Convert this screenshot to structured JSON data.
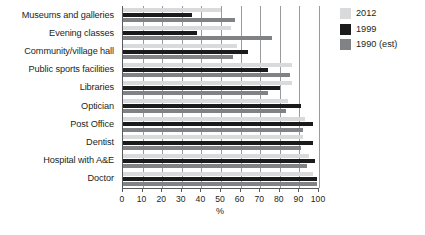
{
  "chart_data": {
    "type": "bar",
    "orientation": "horizontal",
    "title": "",
    "xlabel": "%",
    "ylabel": "",
    "xlim": [
      0,
      100
    ],
    "xticks": [
      0,
      10,
      20,
      30,
      40,
      50,
      60,
      70,
      80,
      90,
      100
    ],
    "grid": true,
    "grid_axis": "x",
    "legend_position": "right-top",
    "categories": [
      "Museums and galleries",
      "Evening classes",
      "Community/village hall",
      "Public sports facilities",
      "Libraries",
      "Optician",
      "Post Office",
      "Dentist",
      "Hospital with A&E",
      "Doctor"
    ],
    "series": [
      {
        "name": "2012",
        "color": "#d9dadb",
        "values": [
          50,
          55,
          58,
          86,
          86,
          84,
          93,
          92,
          95,
          97
        ]
      },
      {
        "name": "1999",
        "color": "#1b1b1b",
        "values": [
          35,
          38,
          64,
          74,
          80,
          91,
          97,
          97,
          98,
          99
        ]
      },
      {
        "name": "1990 (est)",
        "color": "#808285",
        "values": [
          57,
          76,
          56,
          85,
          74,
          83,
          92,
          91,
          94,
          99
        ]
      }
    ]
  },
  "legend": {
    "items": [
      {
        "label": "2012",
        "swatch": "legend-swatch-2012"
      },
      {
        "label": "1999",
        "swatch": "legend-swatch-1999"
      },
      {
        "label": "1990 (est)",
        "swatch": "legend-swatch-1990"
      }
    ]
  },
  "axis": {
    "x_title": "%",
    "tick_labels": [
      "0",
      "10",
      "20",
      "30",
      "40",
      "50",
      "60",
      "70",
      "80",
      "90",
      "100"
    ]
  }
}
